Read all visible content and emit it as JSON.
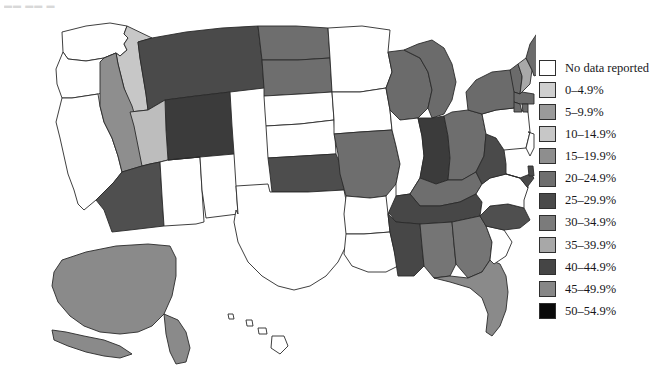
{
  "partial_title_fragment": "▬▬ ▬▬ ▬",
  "legend": {
    "name": "map-legend",
    "items": [
      {
        "label": "No data reported",
        "color": "#ffffff",
        "range": null
      },
      {
        "label": "0–4.9%",
        "color": "#cfcfcf",
        "range": [
          0,
          4.9
        ]
      },
      {
        "label": "5–9.9%",
        "color": "#9a9a9a",
        "range": [
          5,
          9.9
        ]
      },
      {
        "label": "10–14.9%",
        "color": "#c7c7c7",
        "range": [
          10,
          14.9
        ]
      },
      {
        "label": "15–19.9%",
        "color": "#8e8e8e",
        "range": [
          15,
          19.9
        ]
      },
      {
        "label": "20–24.9%",
        "color": "#6e6e6e",
        "range": [
          20,
          24.9
        ]
      },
      {
        "label": "25–29.9%",
        "color": "#4a4a4a",
        "range": [
          25,
          29.9
        ]
      },
      {
        "label": "30–34.9%",
        "color": "#7b7b7b",
        "range": [
          30,
          34.9
        ]
      },
      {
        "label": "35–39.9%",
        "color": "#a8a8a8",
        "range": [
          35,
          39.9
        ]
      },
      {
        "label": "40–44.9%",
        "color": "#454545",
        "range": [
          40,
          44.9
        ]
      },
      {
        "label": "45–49.9%",
        "color": "#878787",
        "range": [
          45,
          49.9
        ]
      },
      {
        "label": "50–54.9%",
        "color": "#0a0a0a",
        "range": [
          50,
          54.9
        ]
      }
    ]
  },
  "chart_data": {
    "type": "choropleth-map",
    "title": "",
    "region": "United States",
    "unit": "percent",
    "legend_position": "right",
    "no_data_color": "#ffffff",
    "categories": [
      "No data reported",
      "0–4.9%",
      "5–9.9%",
      "10–14.9%",
      "15–19.9%",
      "20–24.9%",
      "25–29.9%",
      "30–34.9%",
      "35–39.9%",
      "40–44.9%",
      "45–49.9%",
      "50–54.9%"
    ],
    "states": [
      {
        "code": "WA",
        "name": "Washington",
        "bin": "No data reported",
        "color": "#ffffff"
      },
      {
        "code": "OR",
        "name": "Oregon",
        "bin": "No data reported",
        "color": "#ffffff"
      },
      {
        "code": "CA",
        "name": "California",
        "bin": "No data reported",
        "color": "#ffffff"
      },
      {
        "code": "ID",
        "name": "Idaho",
        "bin": "10–14.9%",
        "color": "#c7c7c7"
      },
      {
        "code": "NV",
        "name": "Nevada",
        "bin": "15–19.9%",
        "color": "#8e8e8e"
      },
      {
        "code": "MT",
        "name": "Montana",
        "bin": "25–29.9%",
        "color": "#4a4a4a"
      },
      {
        "code": "WY",
        "name": "Wyoming",
        "bin": "40–44.9%",
        "color": "#3b3b3b"
      },
      {
        "code": "UT",
        "name": "Utah",
        "bin": "10–14.9%",
        "color": "#bdbdbd"
      },
      {
        "code": "AZ",
        "name": "Arizona",
        "bin": "25–29.9%",
        "color": "#4f4f4f"
      },
      {
        "code": "NM",
        "name": "New Mexico",
        "bin": "No data reported",
        "color": "#ffffff"
      },
      {
        "code": "CO",
        "name": "Colorado",
        "bin": "No data reported",
        "color": "#ffffff"
      },
      {
        "code": "ND",
        "name": "North Dakota",
        "bin": "20–24.9%",
        "color": "#6e6e6e"
      },
      {
        "code": "SD",
        "name": "South Dakota",
        "bin": "20–24.9%",
        "color": "#6e6e6e"
      },
      {
        "code": "NE",
        "name": "Nebraska",
        "bin": "No data reported",
        "color": "#ffffff"
      },
      {
        "code": "KS",
        "name": "Kansas",
        "bin": "No data reported",
        "color": "#ffffff"
      },
      {
        "code": "OK",
        "name": "Oklahoma",
        "bin": "25–29.9%",
        "color": "#4d4d4d"
      },
      {
        "code": "TX",
        "name": "Texas",
        "bin": "No data reported",
        "color": "#ffffff"
      },
      {
        "code": "MN",
        "name": "Minnesota",
        "bin": "No data reported",
        "color": "#ffffff"
      },
      {
        "code": "IA",
        "name": "Iowa",
        "bin": "No data reported",
        "color": "#ffffff"
      },
      {
        "code": "MO",
        "name": "Missouri",
        "bin": "20–24.9%",
        "color": "#6e6e6e"
      },
      {
        "code": "AR",
        "name": "Arkansas",
        "bin": "No data reported",
        "color": "#ffffff"
      },
      {
        "code": "LA",
        "name": "Louisiana",
        "bin": "No data reported",
        "color": "#ffffff"
      },
      {
        "code": "WI",
        "name": "Wisconsin",
        "bin": "20–24.9%",
        "color": "#6b6b6b"
      },
      {
        "code": "IL",
        "name": "Illinois",
        "bin": "No data reported",
        "color": "#ffffff"
      },
      {
        "code": "MI",
        "name": "Michigan",
        "bin": "20–24.9%",
        "color": "#6b6b6b"
      },
      {
        "code": "IN",
        "name": "Indiana",
        "bin": "40–44.9%",
        "color": "#3b3b3b"
      },
      {
        "code": "OH",
        "name": "Ohio",
        "bin": "20–24.9%",
        "color": "#6e6e6e"
      },
      {
        "code": "KY",
        "name": "Kentucky",
        "bin": "20–24.9%",
        "color": "#6e6e6e"
      },
      {
        "code": "TN",
        "name": "Tennessee",
        "bin": "25–29.9%",
        "color": "#474747"
      },
      {
        "code": "MS",
        "name": "Mississippi",
        "bin": "25–29.9%",
        "color": "#474747"
      },
      {
        "code": "AL",
        "name": "Alabama",
        "bin": "20–24.9%",
        "color": "#757575"
      },
      {
        "code": "GA",
        "name": "Georgia",
        "bin": "20–24.9%",
        "color": "#757575"
      },
      {
        "code": "FL",
        "name": "Florida",
        "bin": "15–19.9%",
        "color": "#8a8a8a"
      },
      {
        "code": "SC",
        "name": "South Carolina",
        "bin": "No data reported",
        "color": "#ffffff"
      },
      {
        "code": "NC",
        "name": "North Carolina",
        "bin": "25–29.9%",
        "color": "#4f4f4f"
      },
      {
        "code": "VA",
        "name": "Virginia",
        "bin": "No data reported",
        "color": "#ffffff"
      },
      {
        "code": "WV",
        "name": "West Virginia",
        "bin": "25–29.9%",
        "color": "#4a4a4a"
      },
      {
        "code": "MD",
        "name": "Maryland",
        "bin": "25–29.9%",
        "color": "#4a4a4a"
      },
      {
        "code": "DE",
        "name": "Delaware",
        "bin": "25–29.9%",
        "color": "#4a4a4a"
      },
      {
        "code": "PA",
        "name": "Pennsylvania",
        "bin": "No data reported",
        "color": "#ffffff"
      },
      {
        "code": "NJ",
        "name": "New Jersey",
        "bin": "No data reported",
        "color": "#ffffff"
      },
      {
        "code": "NY",
        "name": "New York",
        "bin": "20–24.9%",
        "color": "#6b6b6b"
      },
      {
        "code": "CT",
        "name": "Connecticut",
        "bin": "20–24.9%",
        "color": "#6b6b6b"
      },
      {
        "code": "RI",
        "name": "Rhode Island",
        "bin": "20–24.9%",
        "color": "#6b6b6b"
      },
      {
        "code": "MA",
        "name": "Massachusetts",
        "bin": "20–24.9%",
        "color": "#6b6b6b"
      },
      {
        "code": "VT",
        "name": "Vermont",
        "bin": "20–24.9%",
        "color": "#6b6b6b"
      },
      {
        "code": "NH",
        "name": "New Hampshire",
        "bin": "35–39.9%",
        "color": "#a8a8a8"
      },
      {
        "code": "ME",
        "name": "Maine",
        "bin": "20–24.9%",
        "color": "#6b6b6b"
      },
      {
        "code": "AK",
        "name": "Alaska",
        "bin": "15–19.9%",
        "color": "#8a8a8a"
      },
      {
        "code": "HI",
        "name": "Hawaii",
        "bin": "No data reported",
        "color": "#ffffff"
      }
    ]
  }
}
